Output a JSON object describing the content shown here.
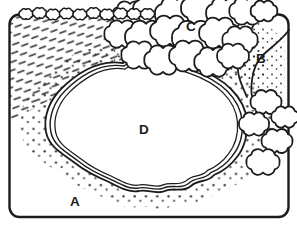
{
  "colors": {
    "ink": "#1c1c1c",
    "paper": "#ffffff"
  },
  "labels": {
    "A": "A",
    "B": "B",
    "C": "C",
    "D": "D"
  }
}
